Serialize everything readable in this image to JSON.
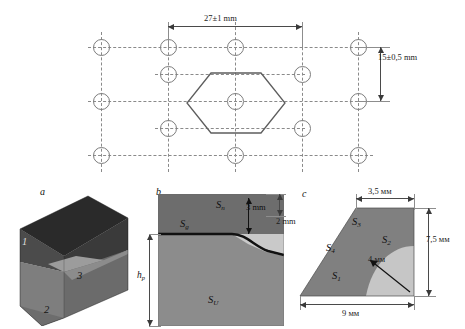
{
  "top_panel": {
    "name": "hole-pattern-drawing",
    "dim_horizontal": "27±1 mm",
    "dim_vertical": "15±0,5 mm",
    "hole_count": 11,
    "hexagon_label": "central hexagon outline"
  },
  "panel_a": {
    "letter": "a",
    "labels": [
      {
        "id": "1",
        "text": "1"
      },
      {
        "id": "2",
        "text": "2"
      },
      {
        "id": "3",
        "text": "3"
      }
    ],
    "colors": {
      "top_face": "#2b2b2b",
      "left_face": "#6f6f6f",
      "front_face": "#7c7c7c",
      "right_face": "#585858",
      "insert": "#9a9a9a"
    }
  },
  "panel_b": {
    "letter": "b",
    "labels": {
      "s_n": "S",
      "s_n_sub": "n",
      "s_g": "S",
      "s_g_sub": "g",
      "s_u": "S",
      "s_u_sub": "U",
      "h_p": "h",
      "h_p_sub": "p"
    },
    "dim_3mm": "3 mm",
    "dim_2mm": "2 mm",
    "colors": {
      "upper": "#6d6d6d",
      "lower": "#8c8c8c",
      "pocket": "#c9c9c9"
    }
  },
  "panel_c": {
    "letter": "c",
    "labels": {
      "s1": "S",
      "s1_sub": "1",
      "s2": "S",
      "s2_sub": "2",
      "s3": "S",
      "s3_sub": "3",
      "s4": "S",
      "s4_sub": "4"
    },
    "dim_top": "3,5 мм",
    "dim_right": "7,5 мм",
    "dim_bottom": "9 мм",
    "dim_radius": "4 мм",
    "colors": {
      "body": "#808080",
      "fillet": "#c6c6c6"
    }
  }
}
